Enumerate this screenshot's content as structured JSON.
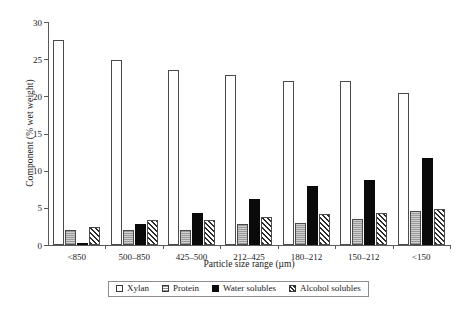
{
  "chart_data": {
    "type": "bar",
    "title": "",
    "xlabel": "Particle size range (µm)",
    "ylabel": "Component (% wet weight)",
    "categories": [
      "<850",
      "500–850",
      "425–500",
      "212–425",
      "180–212",
      "150–212",
      "<150"
    ],
    "series": [
      {
        "name": "Xylan",
        "values": [
          27.6,
          24.9,
          23.6,
          22.9,
          22.1,
          22.1,
          20.5
        ],
        "fill": "open-white",
        "color": "#ffffff"
      },
      {
        "name": "Protein",
        "values": [
          2.0,
          2.0,
          2.0,
          2.8,
          3.0,
          3.5,
          4.6
        ],
        "fill": "gray-dotted",
        "color": "#b0b0b0"
      },
      {
        "name": "Water solubles",
        "values": [
          0.2,
          2.8,
          4.3,
          6.2,
          8.0,
          8.7,
          11.7
        ],
        "fill": "solid-black",
        "color": "#0a0a0a"
      },
      {
        "name": "Alcohol solubles",
        "values": [
          2.4,
          3.3,
          3.4,
          3.8,
          4.2,
          4.3,
          4.8
        ],
        "fill": "diag-hatch",
        "color": "#2b2b2b"
      }
    ],
    "ylim": [
      0,
      30
    ],
    "yticks": [
      0,
      5,
      10,
      15,
      20,
      25,
      30
    ],
    "ytick_labels": [
      "0",
      "5",
      "10",
      "15",
      "20",
      "25",
      "30"
    ],
    "grid": false,
    "legend_position": "below-axis"
  },
  "legend": {
    "items": [
      {
        "label": "Xylan",
        "swatch": "open-square-icon"
      },
      {
        "label": "Protein",
        "swatch": "dotted-square-icon"
      },
      {
        "label": "Water solubles",
        "swatch": "filled-square-icon"
      },
      {
        "label": "Alcohol solubles",
        "swatch": "hatched-square-icon"
      }
    ]
  }
}
